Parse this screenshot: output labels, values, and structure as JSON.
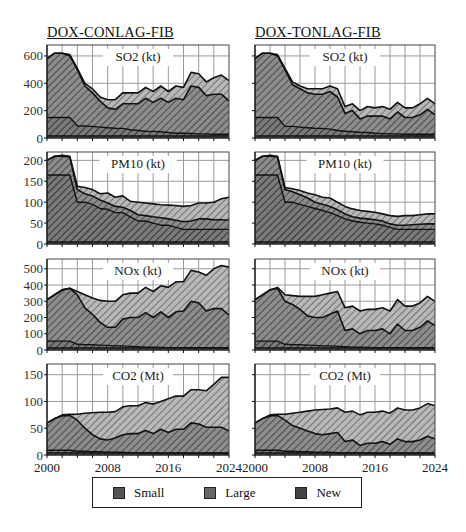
{
  "titles": {
    "left": "DOX-CONLAG-FIB",
    "right": "DOX-TONLAG-FIB"
  },
  "legend": {
    "items": [
      {
        "label": "Small",
        "color": "#8a8a8a"
      },
      {
        "label": "Large",
        "color": "#a9a9a9"
      },
      {
        "label": "New",
        "color": "#6e6e6e"
      }
    ]
  },
  "colors": {
    "small_fill": "#8c8c8c",
    "large_fill": "#b5b5b5",
    "new_fill": "#7a7a7a",
    "hatch": "#3a3a3a",
    "grid": "#9a9a9a",
    "line": "#111111"
  },
  "chart_data": [
    {
      "type": "area",
      "stacked": true,
      "column": "DOX-CONLAG-FIB",
      "title": "SO2 (kt)",
      "ylabel": "",
      "xlabel": "",
      "ylim": [
        0,
        680
      ],
      "yticks": [
        0,
        200,
        400,
        600
      ],
      "x": [
        2000,
        2001,
        2002,
        2003,
        2004,
        2005,
        2006,
        2007,
        2008,
        2009,
        2010,
        2011,
        2012,
        2013,
        2014,
        2015,
        2016,
        2017,
        2018,
        2019,
        2020,
        2021,
        2022,
        2023,
        2024
      ],
      "boundaries": {
        "layer1_top": [
          150,
          150,
          150,
          150,
          90,
          88,
          85,
          80,
          75,
          72,
          70,
          60,
          55,
          50,
          48,
          45,
          40,
          35,
          35,
          33,
          30,
          30,
          28,
          28,
          28
        ],
        "layer2_top": [
          580,
          620,
          620,
          600,
          500,
          380,
          330,
          270,
          220,
          210,
          250,
          250,
          250,
          290,
          260,
          290,
          260,
          290,
          280,
          380,
          370,
          310,
          320,
          320,
          270
        ],
        "layer3_top": [
          580,
          620,
          620,
          610,
          510,
          400,
          360,
          300,
          280,
          280,
          330,
          330,
          330,
          370,
          340,
          380,
          340,
          380,
          370,
          480,
          470,
          410,
          440,
          460,
          420
        ]
      },
      "series": [
        {
          "name": "Small",
          "values": [
            150,
            150,
            150,
            150,
            90,
            88,
            85,
            80,
            75,
            72,
            70,
            60,
            55,
            50,
            48,
            45,
            40,
            35,
            35,
            33,
            30,
            30,
            28,
            28,
            28
          ]
        },
        {
          "name": "Large",
          "values": [
            430,
            470,
            470,
            450,
            410,
            292,
            245,
            190,
            145,
            138,
            180,
            190,
            195,
            240,
            212,
            245,
            220,
            255,
            245,
            347,
            340,
            280,
            292,
            292,
            242
          ]
        },
        {
          "name": "New",
          "values": [
            0,
            0,
            0,
            10,
            10,
            20,
            30,
            30,
            60,
            70,
            80,
            80,
            80,
            80,
            80,
            90,
            80,
            90,
            90,
            100,
            100,
            100,
            120,
            140,
            150
          ]
        }
      ]
    },
    {
      "type": "area",
      "stacked": true,
      "column": "DOX-CONLAG-FIB",
      "title": "PM10 (kt)",
      "ylim": [
        0,
        220
      ],
      "yticks": [
        0,
        50,
        100,
        150,
        200
      ],
      "x": [
        2000,
        2001,
        2002,
        2003,
        2004,
        2005,
        2006,
        2007,
        2008,
        2009,
        2010,
        2011,
        2012,
        2013,
        2014,
        2015,
        2016,
        2017,
        2018,
        2019,
        2020,
        2021,
        2022,
        2023,
        2024
      ],
      "boundaries": {
        "layer1_top": [
          165,
          165,
          165,
          165,
          100,
          100,
          95,
          85,
          83,
          75,
          75,
          65,
          55,
          55,
          50,
          45,
          45,
          40,
          35,
          35,
          35,
          35,
          35,
          35,
          35
        ],
        "layer2_top": [
          200,
          210,
          210,
          208,
          130,
          120,
          115,
          105,
          98,
          90,
          88,
          80,
          70,
          68,
          65,
          63,
          60,
          57,
          53,
          55,
          60,
          60,
          58,
          58,
          57
        ],
        "layer3_top": [
          200,
          210,
          212,
          210,
          138,
          135,
          130,
          120,
          122,
          112,
          115,
          102,
          100,
          98,
          96,
          94,
          93,
          92,
          90,
          92,
          98,
          98,
          100,
          108,
          112
        ]
      }
    },
    {
      "type": "area",
      "stacked": true,
      "column": "DOX-CONLAG-FIB",
      "title": "NOx (kt)",
      "ylim": [
        0,
        560
      ],
      "yticks": [
        0,
        100,
        200,
        300,
        400,
        500
      ],
      "x": [
        2000,
        2001,
        2002,
        2003,
        2004,
        2005,
        2006,
        2007,
        2008,
        2009,
        2010,
        2011,
        2012,
        2013,
        2014,
        2015,
        2016,
        2017,
        2018,
        2019,
        2020,
        2021,
        2022,
        2023,
        2024
      ],
      "boundaries": {
        "layer1_top": [
          55,
          55,
          55,
          55,
          35,
          33,
          32,
          30,
          28,
          25,
          25,
          22,
          20,
          18,
          18,
          16,
          15,
          15,
          15,
          14,
          14,
          14,
          14,
          14,
          14
        ],
        "layer2_top": [
          310,
          340,
          370,
          380,
          340,
          260,
          220,
          170,
          140,
          140,
          190,
          200,
          200,
          230,
          200,
          235,
          200,
          235,
          240,
          300,
          290,
          240,
          255,
          255,
          215
        ],
        "layer3_top": [
          310,
          340,
          370,
          380,
          360,
          340,
          320,
          305,
          300,
          300,
          340,
          350,
          350,
          385,
          360,
          395,
          385,
          420,
          420,
          490,
          480,
          460,
          500,
          520,
          510
        ]
      }
    },
    {
      "type": "area",
      "stacked": true,
      "column": "DOX-CONLAG-FIB",
      "title": "CO2 (Mt)",
      "ylim": [
        0,
        170
      ],
      "yticks": [
        0,
        50,
        100,
        150
      ],
      "x": [
        2000,
        2001,
        2002,
        2003,
        2004,
        2005,
        2006,
        2007,
        2008,
        2009,
        2010,
        2011,
        2012,
        2013,
        2014,
        2015,
        2016,
        2017,
        2018,
        2019,
        2020,
        2021,
        2022,
        2023,
        2024
      ],
      "boundaries": {
        "layer1_top": [
          9,
          9,
          9,
          9,
          7,
          7,
          6,
          6,
          5,
          5,
          5,
          4,
          4,
          4,
          4,
          3,
          3,
          3,
          3,
          3,
          3,
          3,
          3,
          3,
          3
        ],
        "layer2_top": [
          60,
          68,
          73,
          74,
          65,
          50,
          38,
          30,
          28,
          32,
          38,
          40,
          40,
          46,
          40,
          48,
          42,
          48,
          48,
          60,
          58,
          52,
          52,
          52,
          45
        ],
        "layer3_top": [
          60,
          68,
          75,
          76,
          76,
          78,
          79,
          80,
          80,
          81,
          90,
          92,
          92,
          98,
          95,
          100,
          105,
          110,
          110,
          122,
          122,
          120,
          132,
          145,
          145
        ]
      }
    },
    {
      "type": "area",
      "stacked": true,
      "column": "DOX-TONLAG-FIB",
      "title": "SO2 (kt)",
      "ylim": [
        0,
        680
      ],
      "yticks": [
        0,
        200,
        400,
        600
      ],
      "x": [
        2000,
        2001,
        2002,
        2003,
        2004,
        2005,
        2006,
        2007,
        2008,
        2009,
        2010,
        2011,
        2012,
        2013,
        2014,
        2015,
        2016,
        2017,
        2018,
        2019,
        2020,
        2021,
        2022,
        2023,
        2024
      ],
      "boundaries": {
        "layer1_top": [
          150,
          150,
          150,
          150,
          85,
          85,
          80,
          75,
          72,
          70,
          65,
          55,
          50,
          45,
          42,
          40,
          35,
          32,
          30,
          30,
          28,
          28,
          28,
          28,
          28
        ],
        "layer2_top": [
          580,
          620,
          620,
          600,
          500,
          390,
          360,
          330,
          320,
          320,
          340,
          300,
          180,
          200,
          140,
          160,
          160,
          160,
          140,
          190,
          150,
          150,
          170,
          210,
          170
        ],
        "layer3_top": [
          580,
          620,
          620,
          610,
          510,
          410,
          380,
          360,
          360,
          360,
          380,
          360,
          230,
          250,
          200,
          230,
          220,
          230,
          210,
          260,
          220,
          220,
          250,
          290,
          250
        ]
      }
    },
    {
      "type": "area",
      "stacked": true,
      "column": "DOX-TONLAG-FIB",
      "title": "PM10 (kt)",
      "ylim": [
        0,
        220
      ],
      "yticks": [
        0,
        50,
        100,
        150,
        200
      ],
      "x": [
        2000,
        2001,
        2002,
        2003,
        2004,
        2005,
        2006,
        2007,
        2008,
        2009,
        2010,
        2011,
        2012,
        2013,
        2014,
        2015,
        2016,
        2017,
        2018,
        2019,
        2020,
        2021,
        2022,
        2023,
        2024
      ],
      "boundaries": {
        "layer1_top": [
          165,
          165,
          165,
          165,
          100,
          100,
          95,
          90,
          85,
          80,
          75,
          68,
          60,
          55,
          52,
          50,
          48,
          45,
          40,
          35,
          35,
          35,
          35,
          35,
          35
        ],
        "layer2_top": [
          200,
          210,
          210,
          208,
          130,
          125,
          118,
          110,
          100,
          95,
          90,
          82,
          72,
          65,
          62,
          60,
          58,
          55,
          48,
          45,
          45,
          46,
          47,
          48,
          48
        ],
        "layer3_top": [
          200,
          210,
          212,
          210,
          135,
          132,
          128,
          122,
          118,
          112,
          110,
          100,
          90,
          84,
          80,
          78,
          76,
          72,
          68,
          66,
          68,
          68,
          70,
          72,
          72
        ]
      }
    },
    {
      "type": "area",
      "stacked": true,
      "column": "DOX-TONLAG-FIB",
      "title": "NOx (kt)",
      "ylim": [
        0,
        560
      ],
      "yticks": [
        0,
        100,
        200,
        300,
        400,
        500
      ],
      "x": [
        2000,
        2001,
        2002,
        2003,
        2004,
        2005,
        2006,
        2007,
        2008,
        2009,
        2010,
        2011,
        2012,
        2013,
        2014,
        2015,
        2016,
        2017,
        2018,
        2019,
        2020,
        2021,
        2022,
        2023,
        2024
      ],
      "boundaries": {
        "layer1_top": [
          55,
          55,
          55,
          55,
          35,
          33,
          32,
          30,
          28,
          25,
          25,
          22,
          20,
          18,
          18,
          16,
          15,
          15,
          15,
          14,
          14,
          14,
          14,
          14,
          14
        ],
        "layer2_top": [
          310,
          340,
          370,
          380,
          300,
          280,
          250,
          210,
          200,
          200,
          220,
          240,
          120,
          130,
          100,
          120,
          120,
          130,
          100,
          160,
          120,
          120,
          140,
          180,
          150
        ],
        "layer3_top": [
          310,
          340,
          370,
          385,
          340,
          335,
          330,
          330,
          330,
          340,
          350,
          360,
          260,
          270,
          240,
          250,
          250,
          260,
          240,
          310,
          270,
          270,
          290,
          330,
          300
        ]
      }
    },
    {
      "type": "area",
      "stacked": true,
      "column": "DOX-TONLAG-FIB",
      "title": "CO2 (Mt)",
      "ylim": [
        0,
        170
      ],
      "yticks": [
        0,
        50,
        100,
        150
      ],
      "xticks": [
        2000,
        2008,
        2016,
        2024
      ],
      "x": [
        2000,
        2001,
        2002,
        2003,
        2004,
        2005,
        2006,
        2007,
        2008,
        2009,
        2010,
        2011,
        2012,
        2013,
        2014,
        2015,
        2016,
        2017,
        2018,
        2019,
        2020,
        2021,
        2022,
        2023,
        2024
      ],
      "boundaries": {
        "layer1_top": [
          9,
          9,
          9,
          9,
          7,
          7,
          6,
          6,
          5,
          5,
          5,
          4,
          4,
          4,
          4,
          3,
          3,
          3,
          3,
          3,
          3,
          3,
          3,
          3,
          3
        ],
        "layer2_top": [
          60,
          68,
          73,
          74,
          65,
          55,
          50,
          45,
          40,
          38,
          40,
          42,
          25,
          28,
          18,
          22,
          22,
          25,
          20,
          30,
          25,
          25,
          28,
          35,
          30
        ],
        "layer3_top": [
          60,
          68,
          75,
          76,
          76,
          78,
          80,
          82,
          84,
          85,
          86,
          88,
          80,
          82,
          75,
          80,
          80,
          82,
          78,
          88,
          84,
          84,
          88,
          96,
          92
        ]
      }
    }
  ],
  "xaxis": {
    "labels_left": [
      "2000",
      "2008",
      "2016",
      "2024"
    ],
    "labels_right": [
      "2000",
      "2008",
      "2016",
      "2024"
    ]
  }
}
